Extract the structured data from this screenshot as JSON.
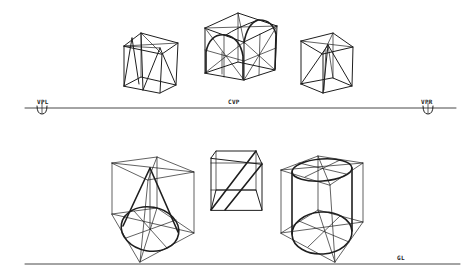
{
  "diagram": {
    "type": "two-point perspective construction drawing",
    "horizon_line": {
      "label_left": "VPL",
      "label_center": "CVP",
      "label_right": "VPR"
    },
    "ground_line": {
      "label": "GL"
    },
    "figures": [
      {
        "name": "cube-with-inverted-pyramid",
        "row": "top",
        "position": "left"
      },
      {
        "name": "cube-with-two-arches",
        "row": "top",
        "position": "center"
      },
      {
        "name": "cube-with-pyramid",
        "row": "top",
        "position": "right"
      },
      {
        "name": "cube-with-cone",
        "row": "bottom",
        "position": "left"
      },
      {
        "name": "cube-with-diagonal-plane",
        "row": "bottom",
        "position": "center"
      },
      {
        "name": "cube-with-cylinder",
        "row": "bottom",
        "position": "right"
      }
    ]
  }
}
